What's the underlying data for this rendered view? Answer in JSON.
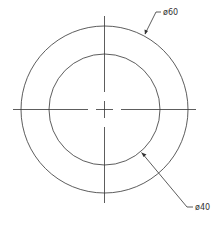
{
  "drawing": {
    "center": {
      "x": 104.5,
      "y": 109.5
    },
    "outer_circle": {
      "radius": 83.5,
      "dimension_label": "ø60"
    },
    "inner_circle": {
      "radius": 55.5,
      "dimension_label": "ø40"
    },
    "line_color": "#333333"
  }
}
